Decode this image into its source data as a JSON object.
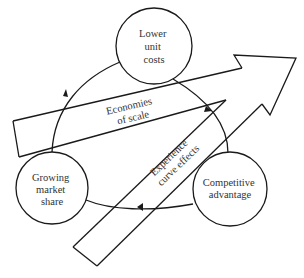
{
  "diagram": {
    "nodes": [
      {
        "id": "lower_unit_costs",
        "lines": [
          "Lower",
          "unit",
          "costs"
        ]
      },
      {
        "id": "competitive_advantage",
        "lines": [
          "Competitive",
          "advantage"
        ]
      },
      {
        "id": "growing_market_share",
        "lines": [
          "Growing",
          "market",
          "share"
        ]
      }
    ],
    "cycle_direction": "clockwise",
    "arrows": [
      {
        "id": "economies_of_scale",
        "lines": [
          "Economies",
          "of scale"
        ]
      },
      {
        "id": "experience_curve_effects",
        "lines": [
          "Experience",
          "curve effects"
        ]
      }
    ],
    "colors": {
      "line": "#1a1a1a",
      "text": "#333333",
      "background": "#ffffff"
    }
  }
}
